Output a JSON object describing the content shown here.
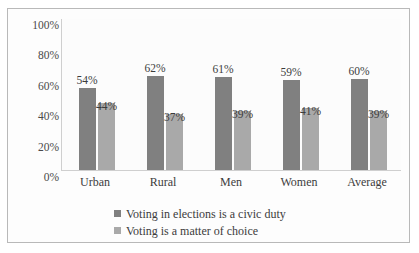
{
  "chart_data": {
    "type": "bar",
    "title": "",
    "xlabel": "",
    "ylabel": "",
    "ylim": [
      0,
      100
    ],
    "yticks": [
      "100%",
      "80%",
      "60%",
      "40%",
      "20%",
      "0%"
    ],
    "grid": false,
    "legend_position": "bottom-left",
    "categories": [
      "Urban",
      "Rural",
      "Men",
      "Women",
      "Average"
    ],
    "series": [
      {
        "name": "Voting in elections is a civic duty",
        "color": "#808080",
        "values": [
          54,
          62,
          61,
          59,
          60
        ],
        "labels": [
          "54%",
          "62%",
          "61%",
          "59%",
          "60%"
        ]
      },
      {
        "name": "Voting is a matter of choice",
        "color": "#a9a9a9",
        "values": [
          44,
          37,
          39,
          41,
          39
        ],
        "labels": [
          "44%",
          "37%",
          "39%",
          "41%",
          "39%"
        ]
      }
    ]
  }
}
